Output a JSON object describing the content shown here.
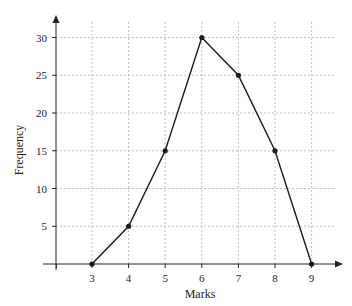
{
  "chart_data": {
    "type": "line",
    "title": "",
    "xlabel": "Marks",
    "ylabel": "Frequency",
    "x": [
      3,
      4,
      5,
      6,
      7,
      8,
      9
    ],
    "series": [
      {
        "name": "Frequency",
        "values": [
          0,
          5,
          15,
          30,
          25,
          15,
          0
        ]
      }
    ],
    "x_ticks": [
      "3",
      "4",
      "5",
      "6",
      "7",
      "8",
      "9"
    ],
    "y_ticks": [
      "5",
      "10",
      "15",
      "20",
      "25",
      "30"
    ],
    "xlim": [
      2,
      9.8
    ],
    "ylim": [
      0,
      32.5
    ],
    "grid": true,
    "grid_style": "dashed",
    "markers": true,
    "legend": "none"
  },
  "colors": {
    "line": "#1a1a1a",
    "grid": "#b0b0b0",
    "axis": "#222222"
  }
}
